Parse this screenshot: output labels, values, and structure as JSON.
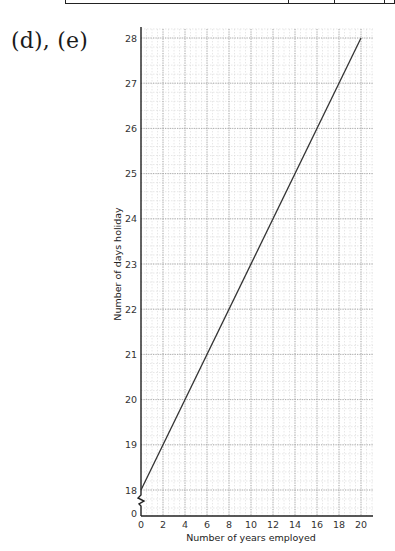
{
  "part_label": "(d), (e)",
  "table_fragment": {
    "dividers_x": [
      222,
      268,
      318
    ]
  },
  "chart_data": {
    "type": "line",
    "title": "",
    "xlabel": "Number of years employed",
    "ylabel": "Number of days holiday",
    "x_ticks": [
      0,
      2,
      4,
      6,
      8,
      10,
      12,
      14,
      16,
      18,
      20
    ],
    "y_ticks": [
      18,
      19,
      20,
      21,
      22,
      23,
      24,
      25,
      26,
      27,
      28
    ],
    "y_origin_label": "0",
    "y_axis_break": true,
    "xlim": [
      0,
      21
    ],
    "ylim": [
      18,
      28.2
    ],
    "grid": true,
    "legend": null,
    "series": [
      {
        "name": "Holiday entitlement",
        "x": [
          0,
          20
        ],
        "y": [
          18,
          28
        ]
      }
    ],
    "colors": {
      "line": "#333333",
      "axis": "#222222",
      "major_grid": "#9a9a9a",
      "minor_grid": "#d6d6d6"
    }
  }
}
